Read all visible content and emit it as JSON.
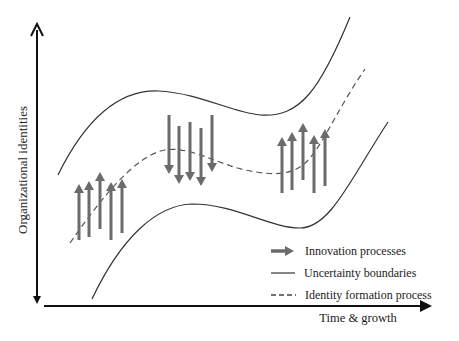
{
  "axes": {
    "y_label": "Organizational identities",
    "x_label": "Time & growth"
  },
  "legend": {
    "items": [
      {
        "symbol": "arrow",
        "label": "Innovation processes"
      },
      {
        "symbol": "solid-line",
        "label": "Uncertainty boundaries"
      },
      {
        "symbol": "dashed-line",
        "label": "Identity formation process"
      }
    ]
  },
  "colors": {
    "axis": "#111111",
    "boundary": "#333333",
    "arrow": "#6b6b6b",
    "text": "#222222"
  },
  "arrow_groups": [
    {
      "direction": "up",
      "position": "early"
    },
    {
      "direction": "down",
      "position": "middle"
    },
    {
      "direction": "up",
      "position": "late"
    }
  ]
}
